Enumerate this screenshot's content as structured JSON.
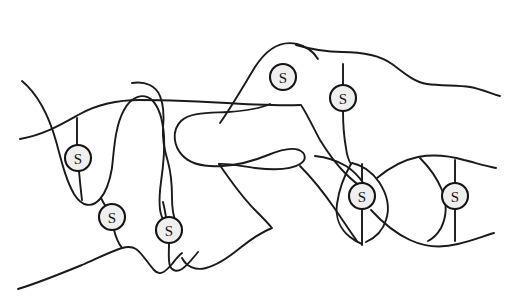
{
  "figure": {
    "background_color": "#ffffff",
    "line_color": "#1a1a1a",
    "node_fill_color": "#efefef",
    "node_stroke_color": "#141414",
    "width": 508,
    "height": 302
  },
  "nodes": [
    {
      "id": "s1",
      "label": "S",
      "cx": 78,
      "cy": 158,
      "r": 13
    },
    {
      "id": "s2",
      "label": "S",
      "cx": 112,
      "cy": 217,
      "r": 13
    },
    {
      "id": "s3",
      "label": "S",
      "cx": 169,
      "cy": 230,
      "r": 13
    },
    {
      "id": "s4",
      "label": "S",
      "cx": 283,
      "cy": 77,
      "r": 13
    },
    {
      "id": "s5",
      "label": "S",
      "cx": 343,
      "cy": 98,
      "r": 13
    },
    {
      "id": "s6",
      "label": "S",
      "cx": 362,
      "cy": 196,
      "r": 13
    },
    {
      "id": "s7",
      "label": "S",
      "cx": 455,
      "cy": 196,
      "r": 13
    }
  ],
  "chains": [
    {
      "id": "chain-upper-long",
      "d": "M 22 81 C 40 96, 50 120, 56 141 C 62 163, 66 180, 74 194 C 82 207, 92 208, 100 199 C 107 191, 110 180, 112 168 C 114 150, 115 126, 124 110 C 131 97, 143 92, 152 100 C 160 108, 163 122, 164 136 C 165 152, 163 168, 161 182 C 159 197, 158 211, 163 219"
    },
    {
      "id": "chain-left-horizontal",
      "d": "M 20 139 C 44 135, 62 124, 80 114 C 98 104, 118 100, 140 100 C 170 100, 210 102, 243 104 C 268 105, 283 106, 300 105"
    },
    {
      "id": "chain-mid-descending",
      "d": "M 132 83 C 146 81, 156 86, 160 96 C 164 106, 164 118, 163 128 C 162 141, 165 152, 168 162 C 171 173, 172 186, 172 197 C 172 208, 173 216, 176 222"
    },
    {
      "id": "chain-pocket-loop",
      "d": "M 270 104 C 259 109, 243 111, 228 112 C 209 113, 190 112, 181 121 C 171 131, 174 146, 182 155 C 191 165, 206 167, 222 166 C 240 165, 256 160, 268 155 C 280 150, 291 147, 299 150 C 306 153, 307 160, 300 164 C 291 170, 273 170, 255 168 C 240 166, 227 163, 219 164"
    },
    {
      "id": "chain-upper-right-arc",
      "d": "M 220 123 C 232 106, 244 85, 255 67 C 266 50, 280 40, 297 44 C 309 47, 315 54, 318 59"
    },
    {
      "id": "chain-top-right-ridge",
      "d": "M 296 45 C 310 49, 326 52, 342 52 C 360 52, 378 54, 392 64 C 404 73, 414 82, 427 84 C 441 86, 458 85, 470 87 C 481 89, 490 93, 500 96"
    },
    {
      "id": "chain-center-to-s6",
      "d": "M 301 105 C 307 114, 313 127, 320 140 C 328 153, 336 164, 345 173 C 352 180, 358 185, 362 187"
    },
    {
      "id": "chain-s5-down",
      "d": "M 343 64 C 343 72, 343 79, 343 85"
    },
    {
      "id": "chain-s5-to-leaf",
      "d": "M 343 111 C 343 124, 344 137, 346 148 C 347 156, 349 161, 351 164"
    },
    {
      "id": "chain-lens-left",
      "d": "M 300 166 C 312 178, 324 193, 335 209 C 344 222, 351 233, 357 241"
    },
    {
      "id": "chain-long-diagonal-down",
      "d": "M 219 164 C 230 180, 242 197, 255 210 C 262 217, 268 223, 272 228 C 262 232, 250 240, 240 248 C 229 257, 218 265, 206 268 C 195 271, 186 266, 182 258"
    },
    {
      "id": "chain-bottom-left-sweep",
      "d": "M 18 289 C 38 283, 60 274, 82 265 C 98 258, 112 251, 122 248 C 129 246, 133 247, 136 249 C 141 252, 147 262, 154 270 C 160 277, 166 271, 172 264 C 176 259, 179 255, 182 253"
    },
    {
      "id": "chain-s3-bottom-hook",
      "d": "M 169 244 C 169 252, 168 260, 170 266 C 172 271, 177 272, 182 269 C 188 265, 193 258, 198 252"
    },
    {
      "id": "chain-lens-mid-upper",
      "d": "M 315 156 C 325 157, 336 160, 346 166 C 354 171, 360 178, 364 184"
    },
    {
      "id": "chain-leaf1-left",
      "d": "M 351 164 C 344 176, 339 190, 337 204 C 335 217, 340 229, 350 237 C 355 241, 359 243, 362 244"
    },
    {
      "id": "chain-leaf1-right",
      "d": "M 352 163 C 362 165, 372 172, 379 182 C 387 194, 390 208, 386 220 C 383 230, 375 238, 366 242"
    },
    {
      "id": "chain-leaf1-spine-top",
      "d": "M 362 164 C 362 172, 362 179, 362 184"
    },
    {
      "id": "chain-leaf1-spine-bottom",
      "d": "M 362 209 C 362 222, 362 235, 362 245"
    },
    {
      "id": "chain-cross-right-upper",
      "d": "M 377 178 C 389 168, 403 160, 418 157 C 434 154, 450 156, 464 160 C 476 163, 486 166, 496 168"
    },
    {
      "id": "chain-cross-right-lower",
      "d": "M 371 210 C 382 222, 395 233, 410 240 C 425 247, 442 248, 458 244 C 472 241, 484 236, 494 233"
    },
    {
      "id": "chain-leaf2-left",
      "d": "M 420 158 C 429 167, 437 178, 442 190 C 447 203, 447 216, 441 228 C 437 235, 432 239, 428 241"
    },
    {
      "id": "chain-leaf2-spine-top",
      "d": "M 455 160 C 455 170, 455 178, 455 183"
    },
    {
      "id": "chain-leaf2-spine-bottom",
      "d": "M 455 209 C 455 222, 455 234, 455 241"
    },
    {
      "id": "chain-s1-stub-up",
      "d": "M 77 118 C 77 130, 77 140, 77 145"
    },
    {
      "id": "chain-s1-stub-down",
      "d": "M 79 171 C 80 182, 81 192, 82 200"
    },
    {
      "id": "chain-s1-to-s2",
      "d": "M 101 198 C 104 204, 107 209, 110 212"
    },
    {
      "id": "chain-s2-down",
      "d": "M 114 230 C 116 238, 119 244, 122 248"
    },
    {
      "id": "chain-s3-up",
      "d": "M 166 217 C 165 211, 164 206, 163 202"
    }
  ]
}
